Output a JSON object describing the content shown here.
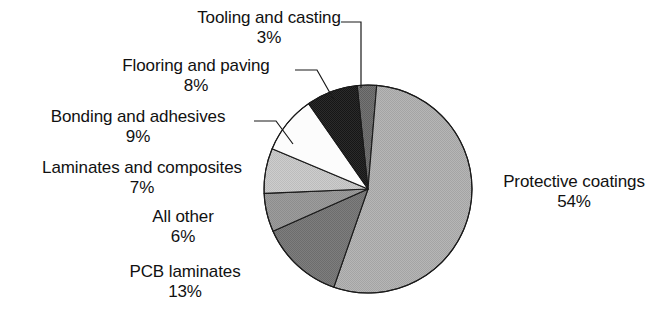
{
  "chart_data": {
    "type": "pie",
    "title": "",
    "xlabel": "",
    "ylabel": "",
    "unit": "%",
    "legend_position": "none",
    "grid": false,
    "categories": [
      "Tooling and casting",
      "Protective coatings",
      "PCB laminates",
      "All other",
      "Laminates and composites",
      "Bonding and adhesives",
      "Flooring and paving"
    ],
    "values": [
      3,
      54,
      13,
      6,
      7,
      9,
      8
    ],
    "slices": [
      {
        "label": "Tooling and casting",
        "value": 3,
        "value_text": "3%",
        "color": "#6e6e6e",
        "start_angle": 354,
        "end_angle": 364.8
      },
      {
        "label": "Protective coatings",
        "value": 54,
        "value_text": "54%",
        "color": "#b0b0b0",
        "start_angle": 364.8,
        "end_angle": 559.2
      },
      {
        "label": "PCB laminates",
        "value": 13,
        "value_text": "13%",
        "color": "#787878",
        "start_angle": 559.2,
        "end_angle": 606
      },
      {
        "label": "All other",
        "value": 6,
        "value_text": "6%",
        "color": "#989898",
        "start_angle": 606,
        "end_angle": 627.6
      },
      {
        "label": "Laminates and composites",
        "value": 7,
        "value_text": "7%",
        "color": "#c6c6c6",
        "start_angle": 627.6,
        "end_angle": 652.8
      },
      {
        "label": "Bonding and adhesives",
        "value": 9,
        "value_text": "9%",
        "color": "#fbfbfb",
        "start_angle": 652.8,
        "end_angle": 685.2
      },
      {
        "label": "Flooring and paving",
        "value": 8,
        "value_text": "8%",
        "color": "#262626",
        "start_angle": 685.2,
        "end_angle": 714
      }
    ],
    "geometry": {
      "center_x": 368,
      "center_y": 189,
      "radius": 104,
      "stroke": "#1a1a1a",
      "stroke_width": 1.1,
      "background": "#ffffff"
    }
  },
  "labels": {
    "tooling_and_casting": {
      "name": "Tooling and casting",
      "value": "3%"
    },
    "flooring_and_paving": {
      "name": "Flooring and paving",
      "value": "8%"
    },
    "bonding_and_adhesives": {
      "name": "Bonding and adhesives",
      "value": "9%"
    },
    "laminates_and_composites": {
      "name": "Laminates and composites",
      "value": "7%"
    },
    "all_other": {
      "name": "All other",
      "value": "6%"
    },
    "pcb_laminates": {
      "name": "PCB laminates",
      "value": "13%"
    },
    "protective_coatings": {
      "name": "Protective coatings",
      "value": "54%"
    }
  }
}
